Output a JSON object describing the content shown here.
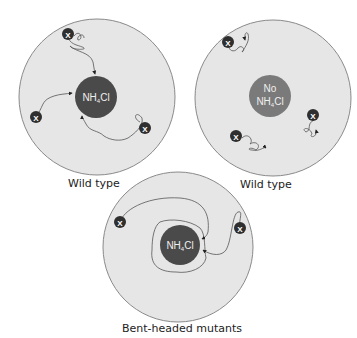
{
  "colors": {
    "dish_fill": "#e6e6e6",
    "dish_stroke": "#8a8a8a",
    "attractant_fill": "#4a4a4a",
    "no_attractant_fill": "#7a7a7a",
    "bacterium_fill": "#2f2f2f",
    "path_stroke": "#555555"
  },
  "panels": [
    {
      "id": "wild-type-with-attractant",
      "center_label_line1": "NH",
      "center_label_sub": "4",
      "center_label_line2": "Cl",
      "caption": "Wild type",
      "bacteria_marker": "X",
      "bacteria_count": 3
    },
    {
      "id": "wild-type-no-attractant",
      "center_label_top": "No",
      "center_label_line1": "NH",
      "center_label_sub": "4",
      "center_label_line2": "Cl",
      "caption": "Wild type",
      "bacteria_marker": "X",
      "bacteria_count": 3
    },
    {
      "id": "bent-headed-mutants",
      "center_label_line1": "NH",
      "center_label_sub": "4",
      "center_label_line2": "Cl",
      "caption": "Bent-headed mutants",
      "bacteria_marker": "X",
      "bacteria_count": 2
    }
  ]
}
